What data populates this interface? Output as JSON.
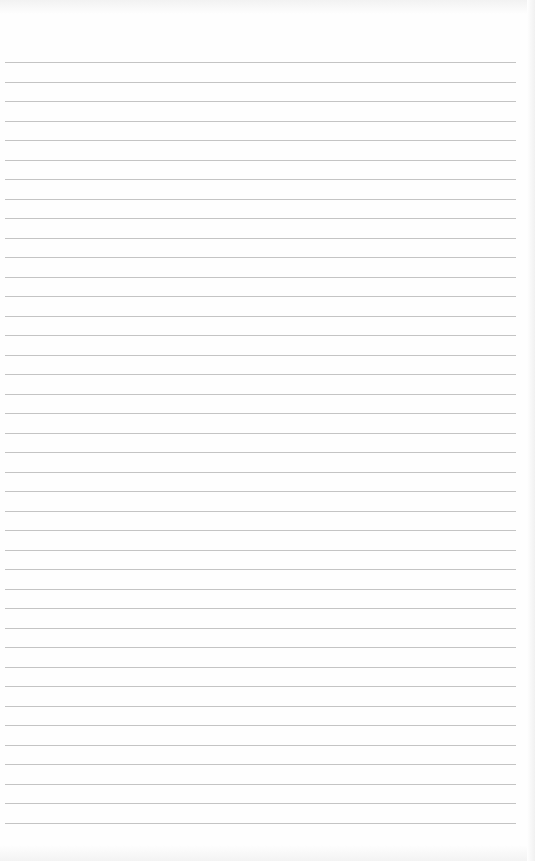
{
  "paper": {
    "type": "lined-paper",
    "background": "#fefefe",
    "line_color": "#c4c4c4",
    "line_count": 40,
    "first_line_y": 62,
    "line_spacing": 19.5,
    "line_left": 5,
    "line_width": 511
  }
}
